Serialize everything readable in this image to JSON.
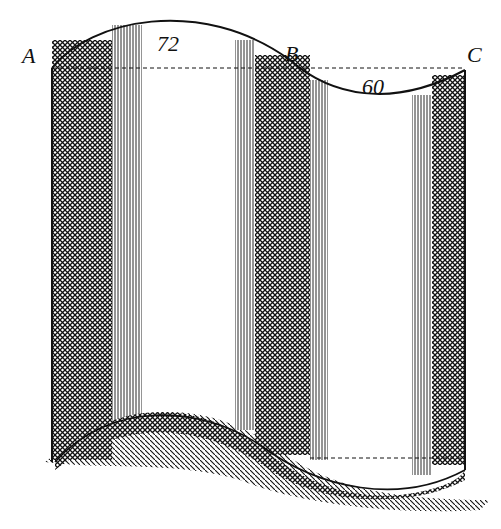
{
  "figure": {
    "labels": {
      "point_a": "A",
      "point_b": "B",
      "point_c": "C",
      "arc_upper_value": "72",
      "arc_lower_value": "60"
    }
  },
  "colors": {
    "ink": "#111111",
    "paper": "#ffffff"
  }
}
